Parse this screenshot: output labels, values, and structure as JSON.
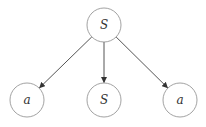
{
  "diagram": {
    "type": "tree",
    "nodes": [
      {
        "id": "root",
        "label": "S"
      },
      {
        "id": "left",
        "label": "a"
      },
      {
        "id": "middle",
        "label": "S"
      },
      {
        "id": "right",
        "label": "a"
      }
    ],
    "edges": [
      {
        "from": "root",
        "to": "left"
      },
      {
        "from": "root",
        "to": "middle"
      },
      {
        "from": "root",
        "to": "right"
      }
    ]
  }
}
